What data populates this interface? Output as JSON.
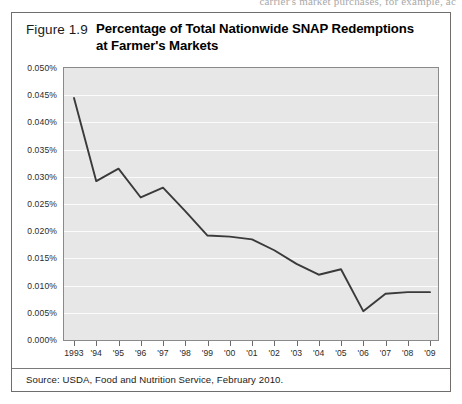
{
  "page_bleed_text": "carrier's market purchases, for example, ac",
  "figure": {
    "number": "Figure 1.9",
    "title_line1": "Percentage of Total Nationwide SNAP Redemptions",
    "title_line2": "at Farmer's Markets",
    "source_note": "Source: USDA, Food and Nutrition Service, February 2010."
  },
  "chart_data": {
    "type": "line",
    "title": "Percentage of Total Nationwide SNAP Redemptions at Farmer's Markets",
    "xlabel": "",
    "ylabel": "",
    "categories": [
      "1993",
      "'94",
      "'95",
      "'96",
      "'97",
      "'98",
      "'99",
      "'00",
      "'01",
      "'02",
      "'03",
      "'04",
      "'05",
      "'06",
      "'07",
      "'08",
      "'09"
    ],
    "x_full_years": [
      1993,
      1994,
      1995,
      1996,
      1997,
      1998,
      1999,
      2000,
      2001,
      2002,
      2003,
      2004,
      2005,
      2006,
      2007,
      2008,
      2009
    ],
    "values": [
      0.0445,
      0.0292,
      0.0315,
      0.0262,
      0.028,
      0.0237,
      0.0192,
      0.019,
      0.0185,
      0.0165,
      0.014,
      0.012,
      0.013,
      0.0053,
      0.0085,
      0.0088,
      0.0088
    ],
    "ylim": [
      0.0,
      0.05
    ],
    "ytick_step": 0.005,
    "ytick_labels": [
      "0.050%",
      "0.045%",
      "0.040%",
      "0.035%",
      "0.030%",
      "0.025%",
      "0.020%",
      "0.015%",
      "0.010%",
      "0.005%",
      "0.000%"
    ],
    "ytick_values": [
      0.05,
      0.045,
      0.04,
      0.035,
      0.03,
      0.025,
      0.02,
      0.015,
      0.01,
      0.005,
      0.0
    ],
    "unit": "percent",
    "grid": true,
    "grid_orientation": "horizontal",
    "legend": null,
    "series_color": "#3a3a3a",
    "plot_background": "#e7e7e7",
    "gridline_color": "#fbfbfb"
  }
}
